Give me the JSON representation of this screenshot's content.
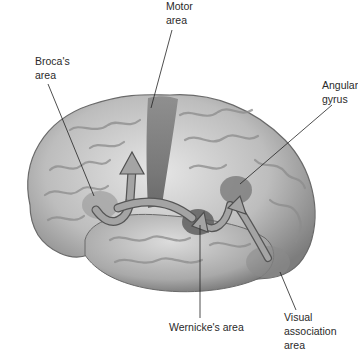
{
  "diagram": {
    "labels": {
      "motor_area": {
        "line1": "Motor",
        "line2": "area"
      },
      "brocas_area": {
        "line1": "Broca's",
        "line2": "area"
      },
      "angular_gyrus": {
        "line1": "Angular",
        "line2": "gyrus"
      },
      "wernickes_area": {
        "line1": "Wernicke's area"
      },
      "visual_association_area": {
        "line1": "Visual",
        "line2": "association",
        "line3": "area"
      }
    },
    "colors": {
      "background": "#ffffff",
      "cortex_light": "#d9d9d9",
      "cortex_mid": "#a8a8a8",
      "cortex_dark": "#6e6e6e",
      "motor_strip": "#7a7a7a",
      "arrow_fill": "#9a9a9a",
      "arrow_stroke": "#555555",
      "leader_line": "#222222",
      "label_text": "#2a2a2a"
    }
  }
}
